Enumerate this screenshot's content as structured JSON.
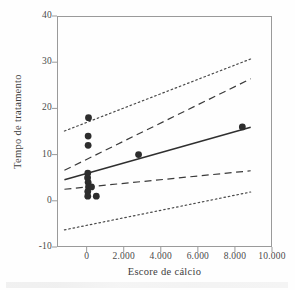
{
  "chart_data": {
    "type": "scatter",
    "title": "",
    "xlabel": "Escore de cálcio",
    "ylabel": "Tempo de tratamento",
    "xlim": [
      -1600,
      10000
    ],
    "ylim": [
      -10,
      40
    ],
    "grid": false,
    "legend": "none",
    "xticks": [
      0,
      2000,
      4000,
      6000,
      8000,
      10000
    ],
    "xtick_labels": [
      "0",
      "2.000",
      "4.000",
      "6.000",
      "8.000",
      "10.000"
    ],
    "yticks": [
      -10,
      0,
      10,
      20,
      30,
      40
    ],
    "ytick_labels": [
      "-10",
      "0",
      "10",
      "20",
      "30",
      "40"
    ],
    "points": [
      {
        "x": 100,
        "y": 18
      },
      {
        "x": 80,
        "y": 14
      },
      {
        "x": 80,
        "y": 12
      },
      {
        "x": 60,
        "y": 6
      },
      {
        "x": 50,
        "y": 5
      },
      {
        "x": 80,
        "y": 4
      },
      {
        "x": 100,
        "y": 3
      },
      {
        "x": 260,
        "y": 3
      },
      {
        "x": 60,
        "y": 2
      },
      {
        "x": 60,
        "y": 1
      },
      {
        "x": 520,
        "y": 1
      },
      {
        "x": 2800,
        "y": 10
      },
      {
        "x": 8400,
        "y": 16
      }
    ],
    "marker": {
      "shape": "circle",
      "size": 3.4,
      "color": "#2d2d2d"
    },
    "series": [
      {
        "name": "Linha de regressão",
        "style": "solid",
        "color": "#2f2f2f",
        "x": [
          -1200,
          8850
        ],
        "y": [
          4.55,
          15.9
        ]
      },
      {
        "name": "Limite superior do intervalo de confiança",
        "style": "dashed",
        "color": "#3a3a3a",
        "x": [
          -1200,
          8850
        ],
        "y": [
          6.6,
          26.4
        ]
      },
      {
        "name": "Limite inferior do intervalo de confiança",
        "style": "dashed",
        "color": "#3a3a3a",
        "x": [
          -1200,
          8850
        ],
        "y": [
          2.5,
          6.5
        ]
      },
      {
        "name": "Limite superior do intervalo de predição",
        "style": "dotted",
        "color": "#4a4a4a",
        "x": [
          -1200,
          8850
        ],
        "y": [
          15.1,
          30.7
        ]
      },
      {
        "name": "Limite inferior do intervalo de predição",
        "style": "dotted",
        "color": "#4a4a4a",
        "x": [
          -1200,
          8850
        ],
        "y": [
          -6.3,
          1.9
        ]
      }
    ]
  }
}
